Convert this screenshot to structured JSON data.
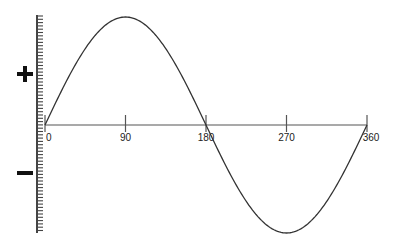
{
  "chart_data": {
    "type": "line",
    "title": "",
    "xlabel": "",
    "ylabel": "",
    "function": "sin(x)",
    "x_unit": "degrees",
    "xlim": [
      0,
      360
    ],
    "ylim": [
      -1,
      1
    ],
    "x_ticks": [
      0,
      90,
      180,
      270,
      360
    ],
    "x_tick_labels": [
      "0",
      "90",
      "180",
      "270",
      "360"
    ],
    "y_axis_markers": {
      "positive": "+",
      "negative": "−"
    },
    "series": [
      {
        "name": "sine wave",
        "x": [
          0,
          30,
          60,
          90,
          120,
          150,
          180,
          210,
          240,
          270,
          300,
          330,
          360
        ],
        "values": [
          0,
          0.5,
          0.866,
          1,
          0.866,
          0.5,
          0,
          -0.5,
          -0.866,
          -1,
          -0.866,
          -0.5,
          0
        ]
      }
    ],
    "grid": false,
    "legend": null
  },
  "labels": {
    "plus": "+",
    "minus": "−"
  },
  "colors": {
    "line": "#333333",
    "axis": "#555555",
    "ruler": "#444444",
    "sign": "#111111"
  }
}
